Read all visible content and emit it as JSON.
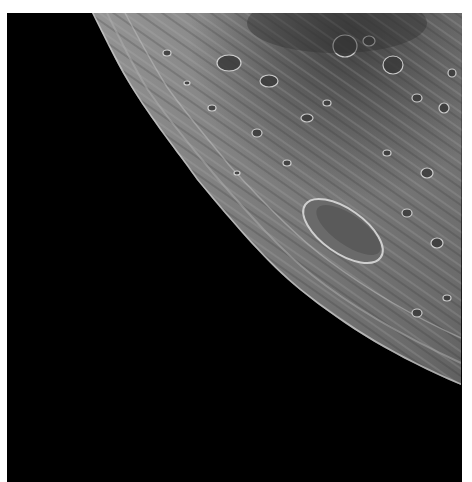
{
  "image": {
    "subject": "Lunar surface near the limb",
    "description": "Grayscale photograph of the Moon's cratered surface curving toward the limb against black space",
    "colors": {
      "space": "#000000",
      "highlands": "#8a8a8a",
      "mare": "#4a4a4a",
      "margin": "#ffffff"
    },
    "features": [
      {
        "name": "limb",
        "type": "horizon-curve"
      },
      {
        "name": "large-elongated-crater",
        "type": "crater"
      },
      {
        "name": "dark-mare-region",
        "type": "mare"
      }
    ]
  }
}
